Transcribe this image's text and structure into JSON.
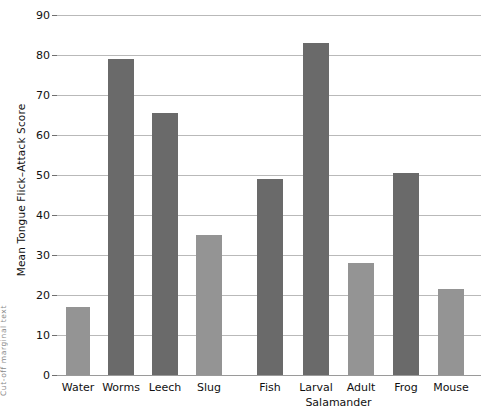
{
  "chart_data": {
    "type": "bar",
    "title": "",
    "subtitle": "",
    "xlabel": "",
    "ylabel": "Mean Tongue Flick–Attack Score",
    "ylim": [
      0,
      90
    ],
    "ytick_step": 10,
    "yticks": [
      0,
      10,
      20,
      30,
      40,
      50,
      60,
      70,
      80,
      90
    ],
    "ytick_labels": [
      "0",
      "10",
      "20",
      "30",
      "40",
      "50",
      "60",
      "70",
      "80",
      "90"
    ],
    "grid": "horizontal",
    "legend": "none",
    "categories": [
      "Water",
      "Worms",
      "Leech",
      "Slug",
      "Fish",
      "Larval",
      "Adult",
      "Frog",
      "Mouse"
    ],
    "values": [
      17,
      79,
      65.5,
      35,
      49,
      83,
      28,
      50.5,
      21.5
    ],
    "bar_shades": [
      "light",
      "dark",
      "dark",
      "light",
      "dark",
      "dark",
      "light",
      "dark",
      "light"
    ],
    "group_annotation": "Salamander",
    "group_annotation_spans": [
      "Larval",
      "Adult"
    ],
    "colors": {
      "bar_dark": "#6a6a6a",
      "bar_light": "#949494",
      "gridline": "#b9b9b9",
      "axis": "#9a9a9a",
      "text": "#111111",
      "background": "#ffffff"
    },
    "gap_between_groups": true
  },
  "edge_marginalia": "Cut-off marginal text",
  "bars": [
    {
      "label": "Water",
      "value": 17,
      "shade": "light",
      "x_center": 21,
      "width": 24
    },
    {
      "label": "Worms",
      "value": 79,
      "shade": "dark",
      "x_center": 64,
      "width": 26
    },
    {
      "label": "Leech",
      "value": 65.5,
      "shade": "dark",
      "x_center": 108,
      "width": 26
    },
    {
      "label": "Slug",
      "value": 35,
      "shade": "light",
      "x_center": 152,
      "width": 26
    },
    {
      "label": "Fish",
      "value": 49,
      "shade": "dark",
      "x_center": 213,
      "width": 26
    },
    {
      "label": "Larval",
      "value": 83,
      "shade": "dark",
      "x_center": 259,
      "width": 26
    },
    {
      "label": "Adult",
      "value": 28,
      "shade": "light",
      "x_center": 304,
      "width": 26
    },
    {
      "label": "Frog",
      "value": 50.5,
      "shade": "dark",
      "x_center": 349,
      "width": 26
    },
    {
      "label": "Mouse",
      "value": 21.5,
      "shade": "light",
      "x_center": 394,
      "width": 26
    }
  ]
}
